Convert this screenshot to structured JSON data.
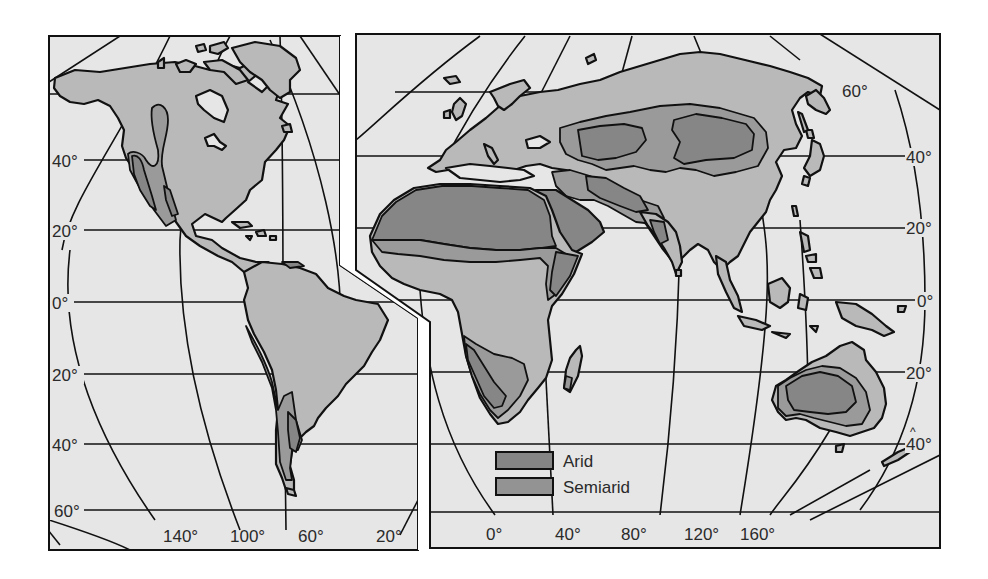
{
  "map": {
    "type": "world-climate-map",
    "subject": "Distribution of arid and semiarid regions",
    "panels": [
      {
        "name": "americas",
        "lat_labels": [
          "40°",
          "20°",
          "0°",
          "20°",
          "40°",
          "60°"
        ],
        "lon_labels": [
          "140°",
          "100°",
          "60°",
          "20°"
        ]
      },
      {
        "name": "eurasia-africa-australia",
        "lat_labels": [
          "60°",
          "40°",
          "20°",
          "0°",
          "20°",
          "40°"
        ],
        "lon_labels": [
          "0°",
          "40°",
          "80°",
          "120°",
          "160°"
        ]
      }
    ],
    "legend": [
      {
        "label": "Arid",
        "color": "#858585"
      },
      {
        "label": "Semiarid",
        "color": "#939393"
      }
    ],
    "colors": {
      "ocean": "#e6e6e6",
      "land": "#b9b9b9",
      "semiarid": "#9a9a9a",
      "arid": "#868686",
      "line": "#111111",
      "background": "#ffffff"
    }
  },
  "left": {
    "lat": {
      "l40": "40°",
      "l20": "20°",
      "l0": "0°",
      "ls20": "20°",
      "ls40": "40°",
      "ls60": "60°"
    },
    "lon": {
      "l140": "140°",
      "l100": "100°",
      "l60": "60°",
      "l20": "20°"
    }
  },
  "right": {
    "lat": {
      "l60": "60°",
      "l40": "40°",
      "l20": "20°",
      "l0": "0°",
      "ls20": "20°",
      "ls40": "40°"
    },
    "lon": {
      "l0": "0°",
      "l40": "40°",
      "l80": "80°",
      "l120": "120°",
      "l160": "160°"
    }
  },
  "legend": {
    "arid": "Arid",
    "semiarid": "Semiarid"
  }
}
